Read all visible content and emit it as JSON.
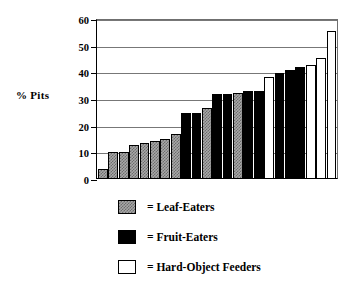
{
  "chart_data": {
    "type": "bar",
    "title": "",
    "xlabel": "",
    "ylabel": "% Pits",
    "ylim": [
      0,
      60
    ],
    "yticks": [
      0,
      10,
      20,
      30,
      40,
      50,
      60
    ],
    "grid": true,
    "legend_position": "below-plot",
    "categories": [
      "1",
      "2",
      "3",
      "4",
      "5",
      "6",
      "7",
      "8",
      "9",
      "10",
      "11",
      "12",
      "13",
      "14",
      "15",
      "16",
      "17",
      "18",
      "19",
      "20",
      "21",
      "22",
      "23"
    ],
    "values": [
      3.5,
      9.8,
      9.8,
      12.5,
      13.3,
      13.8,
      14.5,
      16.4,
      24.3,
      24.3,
      26.3,
      31.5,
      31.5,
      32.0,
      32.5,
      32.5,
      37.8,
      39.5,
      40.4,
      41.8,
      42.5,
      45.0,
      55.0
    ],
    "groups": [
      "leaf",
      "leaf",
      "leaf",
      "leaf",
      "leaf",
      "leaf",
      "leaf",
      "leaf",
      "fruit",
      "fruit",
      "leaf",
      "fruit",
      "fruit",
      "leaf",
      "fruit",
      "fruit",
      "hard",
      "fruit",
      "fruit",
      "fruit",
      "hard",
      "hard",
      "hard"
    ],
    "series": [
      {
        "name": "Leaf-Eaters",
        "key": "leaf",
        "color": "#a8a8a8",
        "pattern": "hatched-gray"
      },
      {
        "name": "Fruit-Eaters",
        "key": "fruit",
        "color": "#000000",
        "pattern": "solid-black"
      },
      {
        "name": "Hard-Object Feeders",
        "key": "hard",
        "color": "#ffffff",
        "pattern": "open-white"
      }
    ],
    "legend": [
      {
        "key": "leaf",
        "label": "= Leaf-Eaters"
      },
      {
        "key": "fruit",
        "label": "= Fruit-Eaters"
      },
      {
        "key": "hard",
        "label": "= Hard-Object Feeders"
      }
    ]
  },
  "axis": {
    "y_label": "% Pits",
    "y_tick_labels": [
      "60",
      "50",
      "40",
      "30",
      "20",
      "10",
      "0"
    ]
  }
}
